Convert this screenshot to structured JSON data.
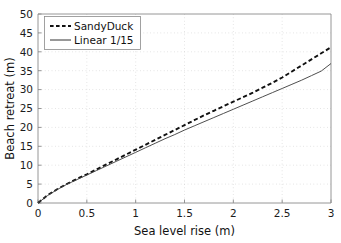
{
  "chart_data": {
    "type": "line",
    "title": "",
    "xlabel": "Sea level rise (m)",
    "ylabel": "Beach retreat (m)",
    "xlim": [
      0,
      3
    ],
    "ylim": [
      0,
      50
    ],
    "xticks": [
      "0",
      "0.5",
      "1",
      "1.5",
      "2",
      "2.5",
      "3"
    ],
    "yticks": [
      "0",
      "5",
      "10",
      "15",
      "20",
      "25",
      "30",
      "35",
      "40",
      "45",
      "50"
    ],
    "grid": true,
    "legend_position": "upper-left",
    "x": [
      0,
      0.1,
      0.2,
      0.3,
      0.4,
      0.5,
      0.6,
      0.7,
      0.8,
      0.9,
      1.0,
      1.1,
      1.2,
      1.3,
      1.4,
      1.5,
      1.6,
      1.7,
      1.8,
      1.9,
      2.0,
      2.1,
      2.2,
      2.3,
      2.4,
      2.5,
      2.6,
      2.7,
      2.8,
      2.9,
      3.0
    ],
    "series": [
      {
        "name": "SandyDuck",
        "style": "dashed",
        "color": "#111111",
        "values": [
          0.0,
          2.1,
          3.7,
          5.1,
          6.4,
          7.6,
          8.9,
          10.2,
          11.5,
          12.8,
          14.1,
          15.4,
          16.7,
          18.0,
          19.3,
          20.6,
          21.9,
          23.2,
          24.4,
          25.6,
          26.8,
          28.0,
          29.2,
          30.5,
          31.8,
          33.2,
          34.8,
          36.4,
          38.0,
          39.6,
          41.2
        ]
      },
      {
        "name": "Linear 1/15",
        "style": "solid",
        "color": "#444444",
        "values": [
          0.0,
          2.0,
          3.6,
          5.0,
          6.2,
          7.4,
          8.6,
          9.8,
          11.0,
          12.2,
          13.4,
          14.6,
          15.8,
          17.0,
          18.1,
          19.3,
          20.4,
          21.5,
          22.6,
          23.7,
          24.8,
          25.9,
          27.0,
          28.1,
          29.2,
          30.3,
          31.4,
          32.5,
          33.7,
          34.9,
          36.9
        ]
      }
    ]
  },
  "legend": {
    "items": [
      {
        "label": "SandyDuck"
      },
      {
        "label": "Linear 1/15"
      }
    ]
  },
  "axes": {
    "x_title": "Sea level rise (m)",
    "y_title": "Beach retreat (m)"
  }
}
